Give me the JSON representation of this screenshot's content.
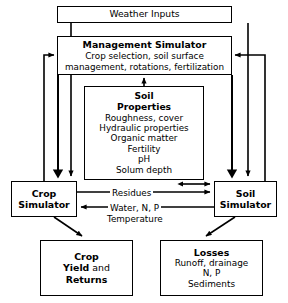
{
  "diagram": {
    "stroke_color": "#000000",
    "background_color": "#ffffff",
    "nodes": {
      "weather": {
        "label": "Weather Inputs"
      },
      "management": {
        "title": "Management Simulator",
        "line1": "Crop selection, soil surface",
        "line2": "management, rotations, fertilization"
      },
      "soil_properties": {
        "title_line1": "Soil",
        "title_line2": "Properties",
        "item1": "Roughness, cover",
        "item2": "Hydraulic properties",
        "item3": "Organic matter",
        "item4": "Fertility",
        "item5": "pH",
        "item6": "Solum depth"
      },
      "crop_simulator": {
        "line1": "Crop",
        "line2": "Simulator"
      },
      "soil_simulator": {
        "line1": "Soil",
        "line2": "Simulator"
      },
      "crop_output": {
        "line1": "Crop",
        "line2_bold": "Yield",
        "line2_plain": " and",
        "line3": "Returns"
      },
      "losses": {
        "title": "Losses",
        "item1": "Runoff, drainage",
        "item2": "N, P",
        "item3": "Sediments"
      }
    },
    "edge_labels": {
      "residues": "Residues",
      "water_n_p": "Water, N, P",
      "temperature": "Temperature"
    }
  }
}
